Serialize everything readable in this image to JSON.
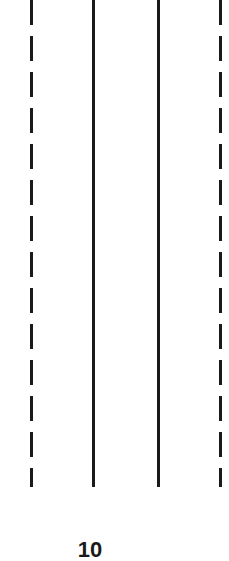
{
  "diagram": {
    "lines": [
      {
        "style": "dashed",
        "x": 31
      },
      {
        "style": "solid",
        "x": 93
      },
      {
        "style": "solid",
        "x": 158
      },
      {
        "style": "dashed",
        "x": 220
      }
    ],
    "label": "10",
    "line_color": "#1a1a1a",
    "background": "#ffffff"
  }
}
